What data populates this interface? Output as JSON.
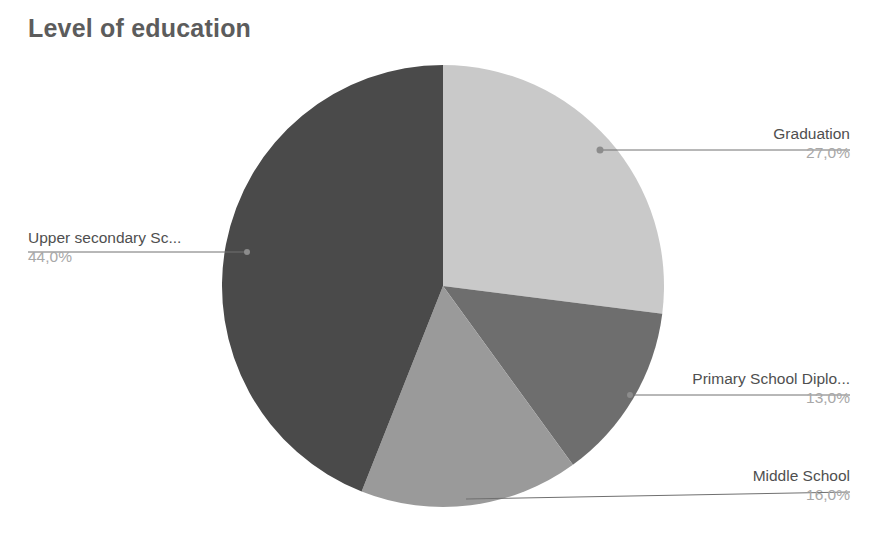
{
  "chart_data": {
    "type": "pie",
    "title": "Level of education",
    "xlabel": "",
    "ylabel": "",
    "legend": "none",
    "grid": false,
    "value_suffix": "%",
    "decimal_separator": ",",
    "start_angle_deg": 0,
    "direction": "clockwise",
    "categories": [
      "Graduation",
      "Primary School Diplo...",
      "Middle School",
      "Upper secondary Sc..."
    ],
    "values": [
      27.0,
      13.0,
      16.0,
      44.0
    ],
    "value_labels": [
      "27,0%",
      "13,0%",
      "16,0%",
      "44,0%"
    ],
    "colors": [
      "#c9c9c9",
      "#6e6e6e",
      "#9a9a9a",
      "#4a4a4a"
    ],
    "slices": [
      {
        "label": "Graduation",
        "value_label": "27,0%",
        "value": 27.0,
        "color": "#c9c9c9"
      },
      {
        "label": "Primary School Diplo...",
        "value_label": "13,0%",
        "value": 13.0,
        "color": "#6e6e6e"
      },
      {
        "label": "Middle School",
        "value_label": "16,0%",
        "value": 16.0,
        "color": "#9a9a9a"
      },
      {
        "label": "Upper secondary Sc...",
        "value_label": "44,0%",
        "value": 44.0,
        "color": "#4a4a4a"
      }
    ]
  },
  "title": {
    "text": "Level of education",
    "color": "#5c5c5c"
  },
  "style": {
    "background": "#ffffff",
    "label_color": "#4f4f4f",
    "value_color": "#a8a8a8",
    "leader_color": "#707070"
  }
}
